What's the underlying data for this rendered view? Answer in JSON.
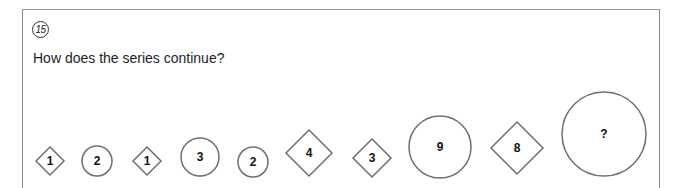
{
  "question": {
    "number": "15",
    "prompt": "How does the series continue?"
  },
  "series": [
    {
      "shape": "diamond",
      "label": "1",
      "cx": 50,
      "cy": 161,
      "size": 14
    },
    {
      "shape": "circle",
      "label": "2",
      "cx": 97,
      "cy": 161,
      "size": 15
    },
    {
      "shape": "diamond",
      "label": "1",
      "cx": 147,
      "cy": 161,
      "size": 14
    },
    {
      "shape": "circle",
      "label": "3",
      "cx": 200,
      "cy": 157,
      "size": 19
    },
    {
      "shape": "circle",
      "label": "2",
      "cx": 253,
      "cy": 162,
      "size": 15
    },
    {
      "shape": "diamond",
      "label": "4",
      "cx": 309,
      "cy": 153,
      "size": 23
    },
    {
      "shape": "diamond",
      "label": "3",
      "cx": 372,
      "cy": 158,
      "size": 19
    },
    {
      "shape": "circle",
      "label": "9",
      "cx": 440,
      "cy": 147,
      "size": 31
    },
    {
      "shape": "diamond",
      "label": "8",
      "cx": 517,
      "cy": 148,
      "size": 26
    },
    {
      "shape": "circle",
      "label": "?",
      "cx": 604,
      "cy": 134,
      "size": 42
    }
  ]
}
